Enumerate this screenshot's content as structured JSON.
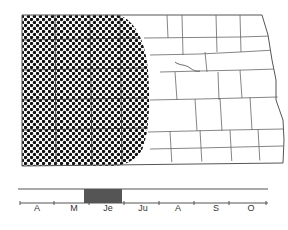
{
  "figure": {
    "type": "distribution-map-with-phenology",
    "region": "North Dakota counties",
    "shaded_region": "western portion of state",
    "shading_pattern": "halftone dots",
    "colors": {
      "dot": "#111111",
      "county_lines": "#555555",
      "bar_fill": "#555555",
      "axis": "#555555"
    }
  },
  "timeline": {
    "months": [
      {
        "label": "A"
      },
      {
        "label": "M"
      },
      {
        "label": "Je"
      },
      {
        "label": "Ju"
      },
      {
        "label": "A"
      },
      {
        "label": "S"
      },
      {
        "label": "O"
      }
    ],
    "active_period": {
      "start": "late May",
      "end": "late June"
    }
  }
}
